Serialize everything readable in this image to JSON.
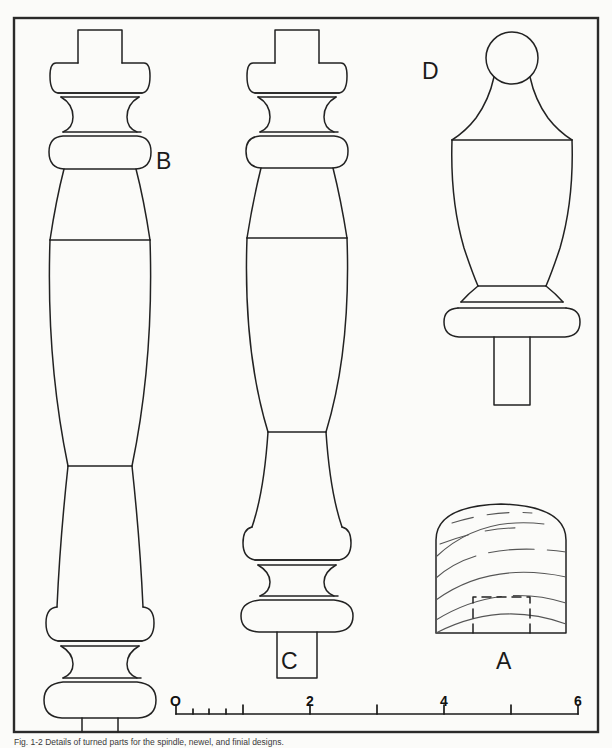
{
  "figure": {
    "title_caption": "Fig. 1-2  Details of turned parts for the spindle, newel, and finial designs.",
    "background_color": "#fbfbf9",
    "ink_color": "#1a1a1a",
    "border": {
      "x": 14,
      "y": 18,
      "width": 584,
      "height": 714,
      "stroke_width": 2.2
    }
  },
  "labels": [
    {
      "id": "B",
      "text": "B",
      "x": 158,
      "y": 150,
      "desc": "long-baluster-label"
    },
    {
      "id": "C",
      "text": "C",
      "x": 282,
      "y": 651,
      "desc": "short-baluster-label"
    },
    {
      "id": "D",
      "text": "D",
      "x": 423,
      "y": 61,
      "desc": "finial-label"
    },
    {
      "id": "A",
      "text": "A",
      "x": 497,
      "y": 651,
      "desc": "stock-block-label"
    }
  ],
  "scale_bar": {
    "x_start": 176,
    "x_end": 578,
    "y_axis": 714,
    "units_total": 6,
    "major_ticks": [
      0,
      1,
      2,
      3,
      4,
      5,
      6
    ],
    "labeled_ticks": [
      {
        "value": 0,
        "text": "O",
        "x": 176
      },
      {
        "value": 2,
        "text": "2",
        "x": 310
      },
      {
        "value": 4,
        "text": "4",
        "x": 444
      },
      {
        "value": 6,
        "text": "6",
        "x": 578
      }
    ],
    "minor_ticks_first_unit": [
      0.25,
      0.5,
      0.75
    ],
    "tick_height_major": 9,
    "tick_height_minor": 5,
    "label_y": 701
  },
  "drawings": {
    "baluster_b": {
      "name": "long-turned-baluster",
      "center_x": 100,
      "top_y": 30,
      "bottom_y": 705,
      "tenon_top": {
        "half_width": 22,
        "y_top": 30,
        "y_bottom": 60
      },
      "ring_upper": {
        "half_width": 44,
        "y_top": 60,
        "y_bottom": 92
      },
      "cove": {
        "half_width": 34,
        "y_top": 96,
        "y_bottom": 118
      },
      "ring_lower": {
        "half_width": 44,
        "y_top": 120,
        "y_bottom": 152
      },
      "vase_widest_y": 240,
      "vase_half_width": 50,
      "waist_y": 460,
      "waist_half_width": 28,
      "foot_ring_upper": {
        "half_width": 44,
        "y_top": 608,
        "y_bottom": 640
      },
      "foot_cove": {
        "half_width": 34,
        "y_top": 643,
        "y_bottom": 662
      },
      "foot_ring_lower": {
        "half_width": 46,
        "y_top": 663,
        "y_bottom": 698
      },
      "tenon_bottom": {
        "half_width": 17,
        "y_top": 698,
        "y_bottom": 728
      }
    },
    "baluster_c": {
      "name": "short-turned-baluster",
      "center_x": 297,
      "top_y": 30,
      "bottom_y": 632,
      "tenon_top": {
        "half_width": 22,
        "y_top": 30,
        "y_bottom": 60
      },
      "ring_upper": {
        "half_width": 44,
        "y_top": 60,
        "y_bottom": 92
      },
      "cove": {
        "half_width": 34,
        "y_top": 96,
        "y_bottom": 118
      },
      "ring_lower": {
        "half_width": 44,
        "y_top": 120,
        "y_bottom": 150
      },
      "vase_widest_y": 238,
      "vase_half_width": 50,
      "trumpet_neck_y": 430,
      "foot_ring_upper": {
        "half_width": 44,
        "y_top": 527,
        "y_bottom": 558
      },
      "foot_cove": {
        "half_width": 34,
        "y_top": 560,
        "y_bottom": 578
      },
      "foot_ring_lower": {
        "half_width": 46,
        "y_top": 580,
        "y_bottom": 612
      },
      "tenon_bottom": {
        "half_width": 20,
        "y_top": 612,
        "y_bottom": 640
      }
    },
    "finial_d": {
      "name": "ball-top-finial",
      "center_x": 512,
      "ball": {
        "cx": 512,
        "cy": 58,
        "r": 26
      },
      "cone_top_y": 84,
      "cone_bottom_y": 140,
      "urn_top_half_width": 61,
      "urn_widest_y": 186,
      "urn_widest_half_width": 64,
      "urn_base_y": 285,
      "urn_base_half_width": 38,
      "collar": {
        "half_width": 52,
        "y_top": 287,
        "y_bottom": 300
      },
      "torus": {
        "half_width": 60,
        "y_top": 300,
        "y_bottom": 326
      },
      "tenon": {
        "half_width": 18,
        "y_top": 326,
        "y_bottom": 405
      }
    },
    "stock_a": {
      "name": "square-stock-block",
      "x_left": 436,
      "x_right": 566,
      "y_top": 504,
      "y_bottom": 633,
      "dome_depth": 34,
      "dashed_tenon": {
        "x_left": 473,
        "x_right": 530,
        "y_top": 597,
        "y_bottom": 633
      },
      "grain_lines": 7
    }
  }
}
